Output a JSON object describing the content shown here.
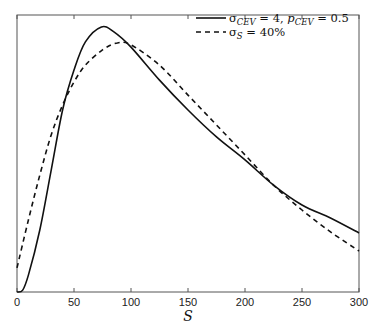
{
  "chart_data": {
    "type": "line",
    "title": "",
    "xlabel": "S",
    "ylabel": "",
    "xlim": [
      0,
      300
    ],
    "ylim": [
      0,
      1
    ],
    "xticks": [
      0,
      50,
      100,
      150,
      200,
      250,
      300
    ],
    "yticks": [],
    "grid": false,
    "legend_position": "upper right",
    "series": [
      {
        "name": "σ_CEV = 4, p_CEV = 0.5",
        "style": "solid",
        "color": "#111111",
        "x": [
          0,
          5,
          10,
          20,
          30,
          40,
          50,
          60,
          74,
          85,
          100,
          125,
          150,
          175,
          200,
          225,
          250,
          275,
          300
        ],
        "values": [
          0.0,
          0.007,
          0.061,
          0.224,
          0.44,
          0.657,
          0.801,
          0.903,
          0.957,
          0.939,
          0.884,
          0.765,
          0.657,
          0.56,
          0.477,
          0.386,
          0.314,
          0.267,
          0.213
        ]
      },
      {
        "name": "σ_S = 40%",
        "style": "dashed",
        "color": "#111111",
        "x": [
          0,
          10,
          20,
          30,
          40,
          50,
          60,
          75,
          88,
          100,
          125,
          150,
          175,
          200,
          225,
          250,
          275,
          300
        ],
        "values": [
          0.087,
          0.26,
          0.422,
          0.567,
          0.675,
          0.758,
          0.819,
          0.874,
          0.899,
          0.892,
          0.819,
          0.711,
          0.603,
          0.495,
          0.386,
          0.296,
          0.217,
          0.148
        ]
      }
    ],
    "legend": [
      {
        "label_main": "σ",
        "label_sub": "CEV",
        "label_rest": " = 4, ",
        "label_p": "p",
        "label_psub": "CEV",
        "label_end": " = 0.5",
        "style": "solid"
      },
      {
        "label_main": "σ",
        "label_sub": "S",
        "label_end": " = 40%",
        "style": "dashed"
      }
    ]
  }
}
